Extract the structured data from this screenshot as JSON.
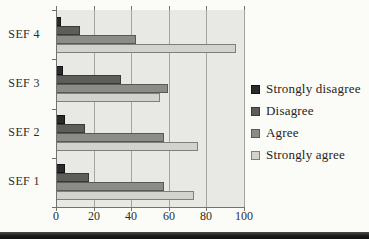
{
  "figure": {
    "background": "#fbfbf7",
    "bottom_rule_color": "#1a1a1a"
  },
  "chart_data": {
    "type": "bar",
    "orientation": "horizontal",
    "title": "",
    "xlabel": "",
    "ylabel": "",
    "categories": [
      "SEF 4",
      "SEF 3",
      "SEF 2",
      "SEF 1"
    ],
    "series": [
      {
        "name": "Strongly disagree",
        "color": "#2b2b2b",
        "border": "#141414",
        "values": [
          2,
          3,
          4,
          4
        ]
      },
      {
        "name": "Disagree",
        "color": "#5d5d5b",
        "border": "#3a3a38",
        "values": [
          12,
          34,
          15,
          17
        ]
      },
      {
        "name": "Agree",
        "color": "#8b8b88",
        "border": "#585855",
        "values": [
          42,
          59,
          57,
          57
        ]
      },
      {
        "name": "Strongly agree",
        "color": "#d3d3ce",
        "border": "#7f7f7c",
        "values": [
          95,
          55,
          75,
          73
        ]
      }
    ],
    "xlim": [
      0,
      100
    ],
    "xticks": [
      0,
      20,
      40,
      60,
      80,
      100
    ],
    "grid": true,
    "legend_position": "right",
    "plot_bg": "#e8e8e4",
    "gridline_color": "#a5a5a0",
    "axis_color": "#72726f",
    "tick_label_color": "#2e2c29"
  }
}
